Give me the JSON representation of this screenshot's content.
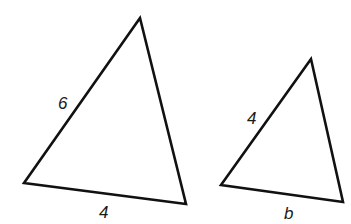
{
  "diagram": {
    "triangles": [
      {
        "name": "large-triangle",
        "vertices": [
          [
            140,
            18
          ],
          [
            24,
            183
          ],
          [
            186,
            204
          ]
        ],
        "labels": [
          {
            "text": "6",
            "x": 58,
            "y": 109,
            "side": "left"
          },
          {
            "text": "4",
            "x": 99,
            "y": 218,
            "side": "bottom"
          }
        ]
      },
      {
        "name": "small-triangle",
        "vertices": [
          [
            311,
            59
          ],
          [
            221,
            185
          ],
          [
            343,
            202
          ]
        ],
        "labels": [
          {
            "text": "4",
            "x": 247,
            "y": 124,
            "side": "left"
          },
          {
            "text": "b",
            "x": 284,
            "y": 219,
            "side": "bottom"
          }
        ]
      }
    ],
    "stroke_color": "#111111"
  }
}
